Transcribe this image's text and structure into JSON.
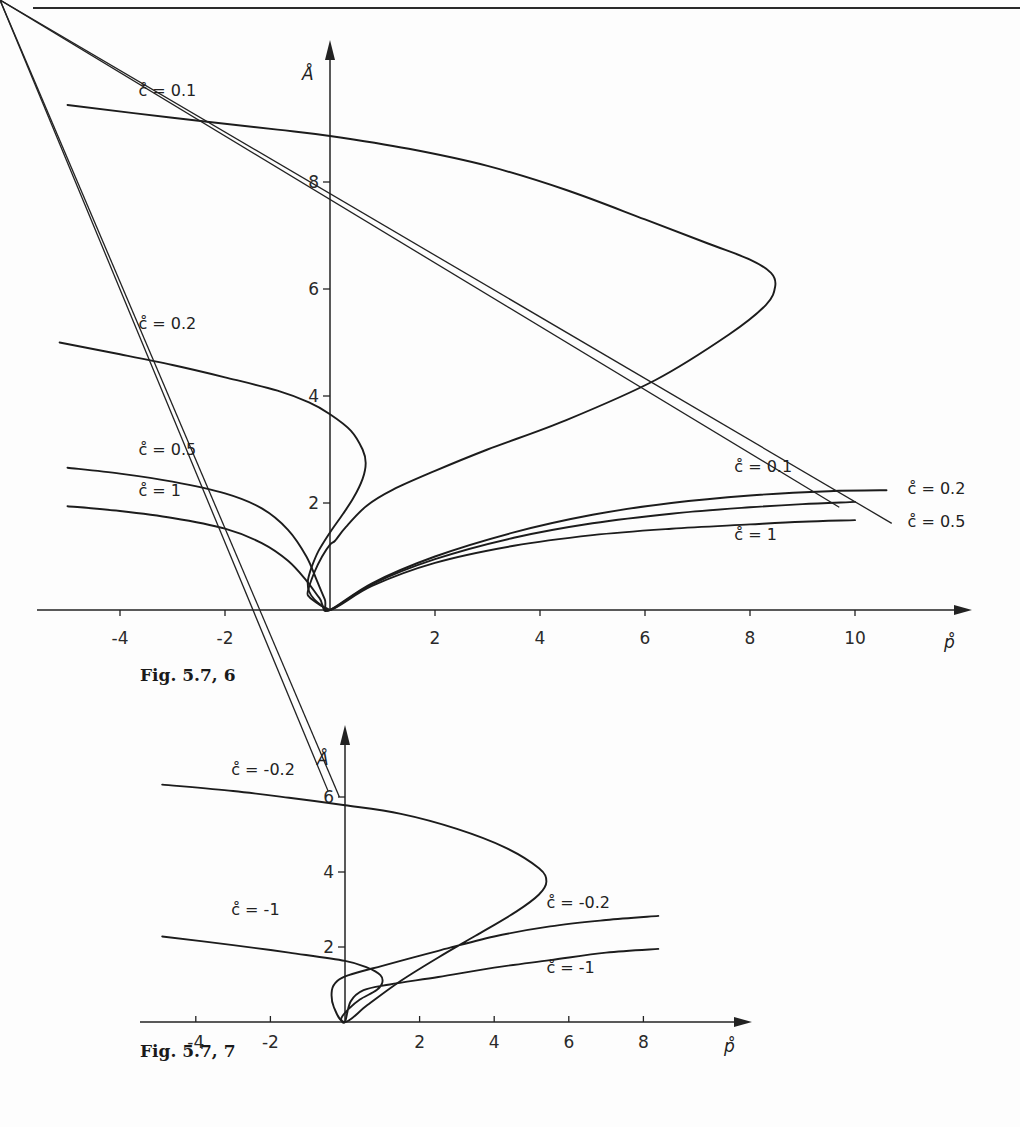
{
  "page": {
    "figures": [
      {
        "caption": "Fig. 5.7, 6"
      },
      {
        "caption": "Fig. 5.7, 7"
      }
    ]
  },
  "chart_data": [
    {
      "type": "line",
      "title": "Fig. 5.7, 6",
      "xlabel": "p̊",
      "ylabel": "Å",
      "xlim": [
        -5.2,
        12.0
      ],
      "ylim": [
        0,
        10.2
      ],
      "xticks": [
        -4,
        -2,
        2,
        4,
        6,
        8,
        10
      ],
      "xtick_labels": [
        "-4",
        "-2",
        "2",
        "4",
        "6",
        "8",
        "10"
      ],
      "yticks": [
        2,
        4,
        6,
        8
      ],
      "ytick_labels": [
        "2",
        "4",
        "6",
        "8"
      ],
      "grid": false,
      "legend": "inline labels",
      "series": [
        {
          "name": "c̊=0.1",
          "label": "c̊ = 0.1",
          "points": [
            [
              -5.0,
              9.44
            ],
            [
              -3.0,
              9.2
            ],
            [
              -1.0,
              8.98
            ],
            [
              0.0,
              8.86
            ],
            [
              1.5,
              8.62
            ],
            [
              3.0,
              8.3
            ],
            [
              4.5,
              7.85
            ],
            [
              6.0,
              7.3
            ],
            [
              7.2,
              6.85
            ],
            [
              8.0,
              6.55
            ],
            [
              8.4,
              6.3
            ],
            [
              8.48,
              6.05
            ],
            [
              8.3,
              5.7
            ],
            [
              7.6,
              5.15
            ],
            [
              6.2,
              4.3
            ],
            [
              4.5,
              3.55
            ],
            [
              3.0,
              3.0
            ],
            [
              2.0,
              2.6
            ],
            [
              1.2,
              2.25
            ],
            [
              0.7,
              1.95
            ],
            [
              0.3,
              1.55
            ],
            [
              0.1,
              1.3
            ],
            [
              0.0,
              1.22
            ],
            [
              -0.15,
              1.0
            ],
            [
              -0.3,
              0.7
            ],
            [
              -0.42,
              0.35
            ],
            [
              -0.4,
              0.25
            ],
            [
              -0.2,
              0.1
            ],
            [
              0.0,
              0.0
            ]
          ]
        },
        {
          "name": "c̊=0.2",
          "label": "c̊ = 0.2",
          "points": [
            [
              -5.15,
              5.0
            ],
            [
              -4.0,
              4.78
            ],
            [
              -3.0,
              4.58
            ],
            [
              -2.0,
              4.35
            ],
            [
              -1.0,
              4.1
            ],
            [
              -0.4,
              3.88
            ],
            [
              0.0,
              3.66
            ],
            [
              0.4,
              3.35
            ],
            [
              0.62,
              3.0
            ],
            [
              0.68,
              2.75
            ],
            [
              0.62,
              2.45
            ],
            [
              0.45,
              2.1
            ],
            [
              0.25,
              1.8
            ],
            [
              0.0,
              1.45
            ],
            [
              -0.22,
              1.1
            ],
            [
              -0.35,
              0.8
            ],
            [
              -0.42,
              0.55
            ],
            [
              -0.4,
              0.35
            ],
            [
              -0.3,
              0.2
            ],
            [
              -0.15,
              0.08
            ],
            [
              0.0,
              0.0
            ],
            [
              0.8,
              0.5
            ],
            [
              2.0,
              1.0
            ],
            [
              3.5,
              1.45
            ],
            [
              5.0,
              1.78
            ],
            [
              6.5,
              2.0
            ],
            [
              8.0,
              2.14
            ],
            [
              9.5,
              2.22
            ],
            [
              10.6,
              2.24
            ]
          ]
        },
        {
          "name": "c̊=0.5",
          "label": "c̊ = 0.5",
          "points": [
            [
              -5.0,
              2.66
            ],
            [
              -4.0,
              2.55
            ],
            [
              -3.0,
              2.4
            ],
            [
              -2.0,
              2.18
            ],
            [
              -1.3,
              1.9
            ],
            [
              -0.8,
              1.5
            ],
            [
              -0.45,
              1.0
            ],
            [
              -0.25,
              0.55
            ],
            [
              -0.1,
              0.2
            ],
            [
              0.0,
              0.0
            ],
            [
              0.8,
              0.48
            ],
            [
              2.0,
              0.95
            ],
            [
              3.5,
              1.35
            ],
            [
              5.0,
              1.62
            ],
            [
              6.5,
              1.8
            ],
            [
              8.0,
              1.92
            ],
            [
              9.0,
              1.98
            ],
            [
              10.0,
              2.02
            ]
          ]
        },
        {
          "name": "c̊=1",
          "label": "c̊ = 1",
          "points": [
            [
              -5.0,
              1.94
            ],
            [
              -4.0,
              1.85
            ],
            [
              -3.0,
              1.72
            ],
            [
              -2.0,
              1.52
            ],
            [
              -1.3,
              1.25
            ],
            [
              -0.8,
              0.92
            ],
            [
              -0.45,
              0.55
            ],
            [
              -0.2,
              0.22
            ],
            [
              0.0,
              0.0
            ],
            [
              0.8,
              0.45
            ],
            [
              2.0,
              0.88
            ],
            [
              3.5,
              1.2
            ],
            [
              5.0,
              1.4
            ],
            [
              6.5,
              1.52
            ],
            [
              8.0,
              1.6
            ],
            [
              9.0,
              1.65
            ],
            [
              10.0,
              1.68
            ]
          ]
        }
      ],
      "annotations": [
        {
          "text": "c̊ = 0.1",
          "at": [
            -3.65,
            9.6
          ],
          "series": "c̊=0.1 (upper branch)"
        },
        {
          "text": "c̊ = 0.2",
          "at": [
            -3.65,
            5.25
          ],
          "series": "c̊=0.2 (left branch)"
        },
        {
          "text": "c̊ = 0.5",
          "at": [
            -3.65,
            2.9
          ],
          "series": "c̊=0.5 (left branch)"
        },
        {
          "text": "c̊ = 1",
          "at": [
            -3.65,
            2.13
          ],
          "series": "c̊=1 (left branch)"
        },
        {
          "text": "c̊ = 0.1",
          "at": [
            7.7,
            2.58
          ],
          "series": "c̊=0.1 (right branch)"
        },
        {
          "text": "c̊ = 0.2",
          "at": [
            11.0,
            2.16
          ],
          "series": "c̊=0.2 (right branch)"
        },
        {
          "text": "c̊ = 0.5",
          "at": [
            11.0,
            1.55
          ],
          "series": "c̊=0.5 (right branch, with leader line)"
        },
        {
          "text": "c̊ = 1",
          "at": [
            7.7,
            1.3
          ],
          "series": "c̊=1 (right branch)"
        }
      ]
    },
    {
      "type": "line",
      "title": "Fig. 5.7, 7",
      "xlabel": "p̊",
      "ylabel": "Å",
      "xlim": [
        -5.5,
        11.0
      ],
      "ylim": [
        0,
        7.8
      ],
      "xticks": [
        -4,
        -2,
        2,
        4,
        6,
        8
      ],
      "xtick_labels": [
        "-4",
        "-2",
        "2",
        "4",
        "6",
        "8"
      ],
      "yticks": [
        2,
        4,
        6
      ],
      "ytick_labels": [
        "2",
        "4",
        "6"
      ],
      "grid": false,
      "legend": "inline labels",
      "series": [
        {
          "name": "c̊=-0.2",
          "label": "c̊ = -0.2",
          "points": [
            [
              -4.9,
              6.33
            ],
            [
              -3.0,
              6.16
            ],
            [
              -1.5,
              5.98
            ],
            [
              0.0,
              5.78
            ],
            [
              1.5,
              5.55
            ],
            [
              3.0,
              5.15
            ],
            [
              4.3,
              4.65
            ],
            [
              5.2,
              4.1
            ],
            [
              5.4,
              3.75
            ],
            [
              5.2,
              3.4
            ],
            [
              4.6,
              2.95
            ],
            [
              3.5,
              2.3
            ],
            [
              2.5,
              1.72
            ],
            [
              1.5,
              1.1
            ],
            [
              0.6,
              0.45
            ],
            [
              0.0,
              0.0
            ],
            [
              -0.3,
              0.4
            ],
            [
              -0.35,
              0.85
            ],
            [
              -0.2,
              1.1
            ],
            [
              0.1,
              1.25
            ],
            [
              1.0,
              1.5
            ],
            [
              2.5,
              1.9
            ],
            [
              4.0,
              2.28
            ],
            [
              5.5,
              2.55
            ],
            [
              7.0,
              2.72
            ],
            [
              8.4,
              2.83
            ]
          ]
        },
        {
          "name": "c̊=-1",
          "label": "c̊ = -1",
          "points": [
            [
              -4.9,
              2.28
            ],
            [
              -3.0,
              2.05
            ],
            [
              -1.5,
              1.85
            ],
            [
              0.0,
              1.63
            ],
            [
              0.6,
              1.45
            ],
            [
              0.95,
              1.25
            ],
            [
              1.0,
              1.05
            ],
            [
              0.85,
              0.85
            ],
            [
              0.4,
              0.6
            ],
            [
              0.1,
              0.35
            ],
            [
              -0.1,
              0.1
            ],
            [
              0.0,
              0.0
            ],
            [
              0.15,
              0.55
            ],
            [
              0.5,
              0.85
            ],
            [
              1.2,
              1.0
            ],
            [
              2.5,
              1.2
            ],
            [
              4.0,
              1.45
            ],
            [
              5.5,
              1.65
            ],
            [
              7.0,
              1.85
            ],
            [
              8.4,
              1.95
            ]
          ]
        }
      ],
      "annotations": [
        {
          "text": "c̊ = -0.2",
          "at": [
            -3.05,
            6.6
          ],
          "series": "c̊=-0.2 (left branch)"
        },
        {
          "text": "c̊ = -1",
          "at": [
            -3.05,
            2.85
          ],
          "series": "c̊=-1 (left branch)"
        },
        {
          "text": "c̊ = -0.2",
          "at": [
            5.4,
            3.05
          ],
          "series": "c̊=-0.2 (right branch)"
        },
        {
          "text": "c̊ = -1",
          "at": [
            5.4,
            1.3
          ],
          "series": "c̊=-1 (right branch)"
        }
      ]
    }
  ]
}
